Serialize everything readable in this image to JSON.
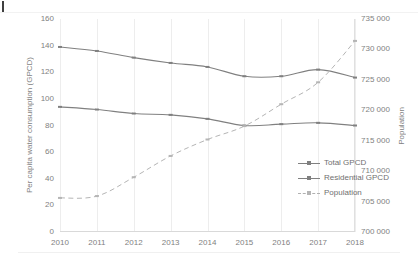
{
  "chart_data": {
    "type": "line",
    "title": "",
    "xlabel": "",
    "ylabel": "Per capita water consumption (GPCD)",
    "y2label": "Population",
    "categories": [
      2010,
      2011,
      2012,
      2013,
      2014,
      2015,
      2016,
      2017,
      2018
    ],
    "xtick_labels": [
      "2010",
      "2011",
      "2012",
      "2013",
      "2014",
      "2015",
      "2016",
      "2017",
      "2018"
    ],
    "ylim": [
      0,
      160
    ],
    "ytick_labels": [
      "0",
      "20",
      "40",
      "60",
      "80",
      "100",
      "120",
      "140",
      "160"
    ],
    "ytick_values": [
      0,
      20,
      40,
      60,
      80,
      100,
      120,
      140,
      160
    ],
    "y2lim": [
      700000,
      735000
    ],
    "y2tick_labels": [
      "700 000",
      "705 000",
      "710 000",
      "715 000",
      "720 000",
      "725 000",
      "730 000",
      "735 000"
    ],
    "y2tick_values": [
      700000,
      705000,
      710000,
      715000,
      720000,
      725000,
      730000,
      735000
    ],
    "grid": "vertical",
    "legend_position": "center-right-inside",
    "series": [
      {
        "name": "Total GPCD",
        "axis": "left",
        "style": "solid",
        "color": "#808080",
        "marker": "dash",
        "values": [
          139,
          136,
          131,
          127,
          124,
          117,
          117,
          122,
          116
        ]
      },
      {
        "name": "Residential GPCD",
        "axis": "left",
        "style": "solid",
        "color": "#808080",
        "marker": "dash",
        "values": [
          94,
          92,
          89,
          88,
          85,
          80,
          81,
          82,
          80
        ]
      },
      {
        "name": "Population",
        "axis": "right",
        "style": "dashed",
        "color": "#b5b5b5",
        "marker": "dash",
        "values": [
          705600,
          705900,
          709000,
          712500,
          715200,
          717400,
          721000,
          724600,
          731400
        ]
      }
    ]
  },
  "legend": {
    "items": [
      {
        "label": "Total GPCD"
      },
      {
        "label": "Residential GPCD"
      },
      {
        "label": "Population"
      }
    ]
  }
}
